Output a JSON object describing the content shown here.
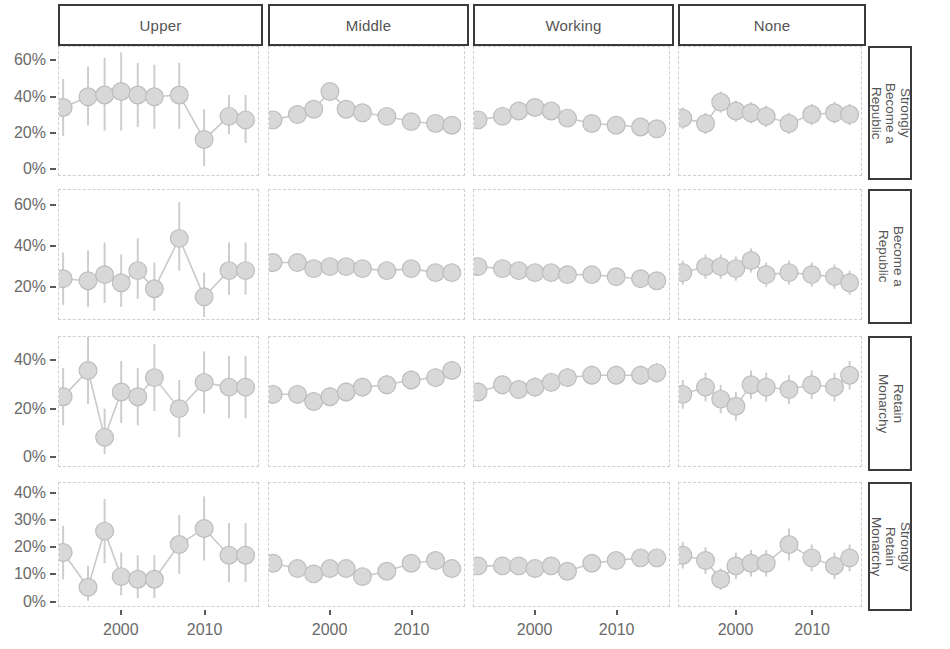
{
  "chart_data": {
    "type": "line",
    "title": "",
    "subtitle": "",
    "xlabel": "",
    "ylabel": "",
    "grid": false,
    "legend": "none",
    "layout": "facet-grid",
    "facet_columns": [
      "Upper",
      "Middle",
      "Working",
      "None"
    ],
    "facet_rows": [
      "Strongly Become a Republic",
      "Become a Republic",
      "Retain Monarchy",
      "Strongly Retain Monarchy"
    ],
    "x_tick_labels": [
      "2000",
      "2010"
    ],
    "x_tick_values": [
      2000,
      2010
    ],
    "xlim": [
      1992.5,
      2016.5
    ],
    "row_axes": [
      {
        "row": "Strongly Become a Republic",
        "y_tick_labels": [
          "0%",
          "20%",
          "40%",
          "60%"
        ],
        "y_tick_values": [
          0,
          20,
          40,
          60
        ],
        "ylim": [
          -4,
          68
        ]
      },
      {
        "row": "Become a Republic",
        "y_tick_labels": [
          "20%",
          "40%",
          "60%"
        ],
        "y_tick_values": [
          20,
          40,
          60
        ],
        "ylim": [
          4,
          68
        ]
      },
      {
        "row": "Retain Monarchy",
        "y_tick_labels": [
          "0%",
          "20%",
          "40%"
        ],
        "y_tick_values": [
          0,
          20,
          40
        ],
        "ylim": [
          -4,
          50
        ]
      },
      {
        "row": "Strongly Retain Monarchy",
        "y_tick_labels": [
          "0%",
          "10%",
          "20%",
          "30%",
          "40%"
        ],
        "y_tick_values": [
          0,
          10,
          20,
          30,
          40
        ],
        "ylim": [
          -2,
          44
        ]
      }
    ],
    "marker": {
      "shape": "circle",
      "fill": "#d8d8d8",
      "stroke": "#bdbdbd",
      "radius_px": 9
    },
    "line_color": "#c9c9c9",
    "errorbar_color": "#cdcdcd",
    "panels": [
      {
        "row": "Strongly Become a Republic",
        "col": "Upper",
        "x": [
          1993,
          1996,
          1998,
          2000,
          2002,
          2004,
          2007,
          2010,
          2013,
          2015
        ],
        "y": [
          34,
          40,
          41,
          43,
          41,
          40,
          41,
          16,
          29,
          27
        ],
        "ylo": [
          18,
          24,
          21,
          21,
          23,
          22,
          22,
          1,
          19,
          14
        ],
        "yhi": [
          50,
          57,
          62,
          65,
          59,
          58,
          59,
          33,
          41,
          41
        ]
      },
      {
        "row": "Strongly Become a Republic",
        "col": "Middle",
        "x": [
          1993,
          1996,
          1998,
          2000,
          2002,
          2004,
          2007,
          2010,
          2013,
          2015
        ],
        "y": [
          27,
          30,
          33,
          43,
          33,
          31,
          29,
          26,
          25,
          24
        ],
        "ylo": [
          23,
          26,
          29,
          39,
          29,
          27,
          25,
          22,
          21,
          20
        ],
        "yhi": [
          31,
          34,
          37,
          47,
          37,
          35,
          33,
          30,
          29,
          28
        ]
      },
      {
        "row": "Strongly Become a Republic",
        "col": "Working",
        "x": [
          1993,
          1996,
          1998,
          2000,
          2002,
          2004,
          2007,
          2010,
          2013,
          2015
        ],
        "y": [
          27,
          29,
          32,
          34,
          32,
          28,
          25,
          24,
          23,
          22
        ],
        "ylo": [
          23,
          25,
          28,
          30,
          28,
          24,
          21,
          20,
          19,
          18
        ],
        "yhi": [
          31,
          33,
          36,
          38,
          36,
          32,
          29,
          28,
          27,
          26
        ]
      },
      {
        "row": "Strongly Become a Republic",
        "col": "None",
        "x": [
          1993,
          1996,
          1998,
          2000,
          2002,
          2004,
          2007,
          2010,
          2013,
          2015
        ],
        "y": [
          28,
          25,
          37,
          32,
          31,
          29,
          25,
          30,
          31,
          30
        ],
        "ylo": [
          22,
          19,
          31,
          26,
          25,
          23,
          19,
          24,
          25,
          24
        ],
        "yhi": [
          34,
          31,
          43,
          38,
          37,
          35,
          31,
          36,
          37,
          36
        ]
      },
      {
        "row": "Become a Republic",
        "col": "Upper",
        "x": [
          1993,
          1996,
          1998,
          2000,
          2002,
          2004,
          2007,
          2010,
          2013,
          2015
        ],
        "y": [
          24,
          23,
          26,
          22,
          28,
          19,
          44,
          15,
          28,
          28
        ],
        "ylo": [
          11,
          10,
          12,
          10,
          14,
          8,
          28,
          5,
          16,
          16
        ],
        "yhi": [
          37,
          38,
          42,
          36,
          44,
          32,
          62,
          27,
          42,
          42
        ]
      },
      {
        "row": "Become a Republic",
        "col": "Middle",
        "x": [
          1993,
          1996,
          1998,
          2000,
          2002,
          2004,
          2007,
          2010,
          2013,
          2015
        ],
        "y": [
          32,
          32,
          29,
          30,
          30,
          29,
          28,
          29,
          27,
          27
        ],
        "ylo": [
          28,
          28,
          25,
          26,
          26,
          25,
          24,
          25,
          23,
          23
        ],
        "yhi": [
          36,
          36,
          33,
          34,
          34,
          33,
          32,
          33,
          31,
          31
        ]
      },
      {
        "row": "Become a Republic",
        "col": "Working",
        "x": [
          1993,
          1996,
          1998,
          2000,
          2002,
          2004,
          2007,
          2010,
          2013,
          2015
        ],
        "y": [
          30,
          29,
          28,
          27,
          27,
          26,
          26,
          25,
          24,
          23
        ],
        "ylo": [
          26,
          25,
          24,
          23,
          23,
          22,
          22,
          21,
          20,
          19
        ],
        "yhi": [
          34,
          33,
          32,
          31,
          31,
          30,
          30,
          29,
          28,
          27
        ]
      },
      {
        "row": "Become a Republic",
        "col": "None",
        "x": [
          1993,
          1996,
          1998,
          2000,
          2002,
          2004,
          2007,
          2010,
          2013,
          2015
        ],
        "y": [
          27,
          30,
          30,
          29,
          33,
          26,
          27,
          26,
          25,
          22
        ],
        "ylo": [
          21,
          24,
          24,
          23,
          27,
          20,
          21,
          20,
          19,
          16
        ],
        "yhi": [
          33,
          36,
          36,
          35,
          39,
          32,
          33,
          32,
          31,
          28
        ]
      },
      {
        "row": "Retain Monarchy",
        "col": "Upper",
        "x": [
          1993,
          1996,
          1998,
          2000,
          2002,
          2004,
          2007,
          2010,
          2013,
          2015
        ],
        "y": [
          25,
          36,
          8,
          27,
          25,
          33,
          20,
          31,
          29,
          29
        ],
        "ylo": [
          13,
          22,
          1,
          14,
          13,
          19,
          8,
          18,
          16,
          16
        ],
        "yhi": [
          37,
          50,
          20,
          40,
          37,
          47,
          32,
          44,
          42,
          42
        ]
      },
      {
        "row": "Retain Monarchy",
        "col": "Middle",
        "x": [
          1993,
          1996,
          1998,
          2000,
          2002,
          2004,
          2007,
          2010,
          2013,
          2015
        ],
        "y": [
          26,
          26,
          23,
          25,
          27,
          29,
          30,
          32,
          33,
          36
        ],
        "ylo": [
          22,
          22,
          19,
          21,
          23,
          25,
          26,
          28,
          29,
          32
        ],
        "yhi": [
          30,
          30,
          27,
          29,
          31,
          33,
          34,
          36,
          37,
          40
        ]
      },
      {
        "row": "Retain Monarchy",
        "col": "Working",
        "x": [
          1993,
          1996,
          1998,
          2000,
          2002,
          2004,
          2007,
          2010,
          2013,
          2015
        ],
        "y": [
          27,
          30,
          28,
          29,
          31,
          33,
          34,
          34,
          34,
          35
        ],
        "ylo": [
          23,
          26,
          24,
          25,
          27,
          29,
          30,
          30,
          30,
          31
        ],
        "yhi": [
          31,
          34,
          32,
          33,
          35,
          37,
          38,
          38,
          38,
          39
        ]
      },
      {
        "row": "Retain Monarchy",
        "col": "None",
        "x": [
          1993,
          1996,
          1998,
          2000,
          2002,
          2004,
          2007,
          2010,
          2013,
          2015
        ],
        "y": [
          26,
          29,
          24,
          21,
          30,
          29,
          28,
          30,
          29,
          34
        ],
        "ylo": [
          20,
          23,
          18,
          15,
          24,
          23,
          22,
          24,
          23,
          28
        ],
        "yhi": [
          32,
          35,
          30,
          27,
          36,
          35,
          34,
          36,
          35,
          40
        ]
      },
      {
        "row": "Strongly Retain Monarchy",
        "col": "Upper",
        "x": [
          1993,
          1996,
          1998,
          2000,
          2002,
          2004,
          2007,
          2010,
          2013,
          2015
        ],
        "y": [
          18,
          5,
          26,
          9,
          8,
          8,
          21,
          27,
          17,
          17
        ],
        "ylo": [
          8,
          0,
          14,
          2,
          1,
          1,
          10,
          15,
          7,
          7
        ],
        "yhi": [
          28,
          13,
          38,
          18,
          17,
          17,
          32,
          39,
          29,
          29
        ]
      },
      {
        "row": "Strongly Retain Monarchy",
        "col": "Middle",
        "x": [
          1993,
          1996,
          1998,
          2000,
          2002,
          2004,
          2007,
          2010,
          2013,
          2015
        ],
        "y": [
          14,
          12,
          10,
          12,
          12,
          9,
          11,
          14,
          15,
          12
        ],
        "ylo": [
          11,
          9,
          7,
          9,
          9,
          6,
          8,
          11,
          12,
          9
        ],
        "yhi": [
          17,
          15,
          13,
          15,
          15,
          12,
          14,
          17,
          18,
          15
        ]
      },
      {
        "row": "Strongly Retain Monarchy",
        "col": "Working",
        "x": [
          1993,
          1996,
          1998,
          2000,
          2002,
          2004,
          2007,
          2010,
          2013,
          2015
        ],
        "y": [
          13,
          13,
          13,
          12,
          13,
          11,
          14,
          15,
          16,
          16
        ],
        "ylo": [
          10,
          10,
          10,
          9,
          10,
          8,
          11,
          12,
          13,
          13
        ],
        "yhi": [
          16,
          16,
          16,
          15,
          16,
          14,
          17,
          18,
          19,
          19
        ]
      },
      {
        "row": "Strongly Retain Monarchy",
        "col": "None",
        "x": [
          1993,
          1996,
          1998,
          2000,
          2002,
          2004,
          2007,
          2010,
          2013,
          2015
        ],
        "y": [
          17,
          15,
          8,
          13,
          14,
          14,
          21,
          16,
          13,
          16
        ],
        "ylo": [
          12,
          10,
          4,
          8,
          9,
          9,
          15,
          11,
          8,
          11
        ],
        "yhi": [
          22,
          20,
          12,
          18,
          19,
          19,
          27,
          21,
          18,
          21
        ]
      }
    ]
  },
  "facets": {
    "columns": [
      {
        "label": "Upper"
      },
      {
        "label": "Middle"
      },
      {
        "label": "Working"
      },
      {
        "label": "None"
      }
    ],
    "rows": [
      {
        "label": "Strongly\nBecome a\nRepublic"
      },
      {
        "label": "Become a\nRepublic"
      },
      {
        "label": "Retain\nMonarchy"
      },
      {
        "label": "Strongly\nRetain\nMonarchy"
      }
    ]
  },
  "axes": {
    "y_labels_row1": [
      "60%",
      "40%",
      "20%",
      "0%"
    ],
    "y_labels_row2": [
      "60%",
      "40%",
      "20%"
    ],
    "y_labels_row3": [
      "40%",
      "20%",
      "0%"
    ],
    "y_labels_row4": [
      "40%",
      "30%",
      "20%",
      "10%",
      "0%"
    ],
    "x_labels": [
      "2000",
      "2010"
    ]
  },
  "colors": {
    "marker_fill": "#d8d8d8",
    "marker_stroke": "#bdbdbd",
    "line": "#c9c9c9",
    "errorbar": "#cdcdcd",
    "strip_border": "#3a3a3a",
    "panel_border": "#cfcfcf",
    "text": "#6a6a6a"
  }
}
